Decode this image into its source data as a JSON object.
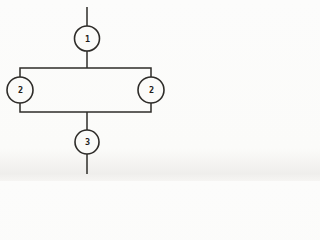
{
  "colors": {
    "paper": "#fbfbf9",
    "line": "#2e2c29",
    "label": "#1f1d1a"
  },
  "nodes": {
    "top": {
      "label": "1"
    },
    "left": {
      "label": "2"
    },
    "right": {
      "label": "2"
    },
    "bottom": {
      "label": "3"
    }
  }
}
